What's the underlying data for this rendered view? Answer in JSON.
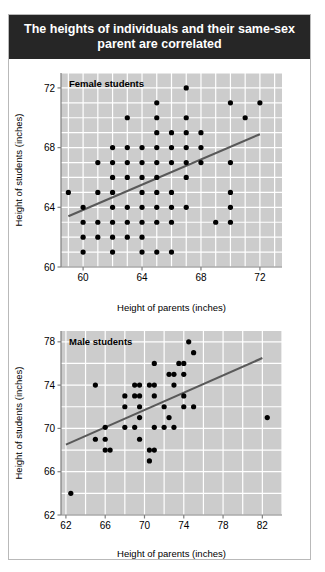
{
  "figure": {
    "title": "The heights of individuals and their same-sex parent are correlated",
    "title_bg": "#262626",
    "title_color": "#ffffff",
    "panel_bg": "#cccccc",
    "grid_color": "#ffffff",
    "point_color": "#000000",
    "line_color": "#595959",
    "axis_color": "#808080",
    "card_bg": "#ffffff",
    "card_border": "#b9b9b9"
  },
  "chart_data": [
    {
      "type": "scatter",
      "name": "female-students-scatter",
      "title": "Female students",
      "xlabel": "Height of parents (inches)",
      "ylabel": "Height of students (inches)",
      "xlim": [
        58.5,
        73.5
      ],
      "ylim": [
        60,
        73
      ],
      "xticks": [
        60,
        64,
        68,
        72
      ],
      "yticks": [
        60,
        64,
        68,
        72
      ],
      "xtick_labels": [
        "60",
        "64",
        "68",
        "72"
      ],
      "ytick_labels": [
        "60",
        "64",
        "68",
        "72"
      ],
      "grid": true,
      "grid_step_x": 1,
      "grid_step_y": 1,
      "legend": "none",
      "trendline": {
        "x0": 59.0,
        "y0": 63.4,
        "x1": 72.0,
        "y1": 68.9
      },
      "points": [
        [
          59.0,
          65.0
        ],
        [
          60.0,
          64.0
        ],
        [
          60.0,
          63.0
        ],
        [
          60.0,
          62.0
        ],
        [
          60.0,
          61.0
        ],
        [
          61.0,
          67.0
        ],
        [
          61.0,
          65.0
        ],
        [
          61.0,
          63.0
        ],
        [
          61.0,
          62.0
        ],
        [
          62.0,
          68.0
        ],
        [
          62.0,
          67.0
        ],
        [
          62.0,
          66.0
        ],
        [
          62.0,
          65.0
        ],
        [
          62.0,
          64.0
        ],
        [
          62.0,
          63.0
        ],
        [
          62.0,
          62.0
        ],
        [
          62.0,
          61.0
        ],
        [
          63.0,
          70.0
        ],
        [
          63.0,
          68.0
        ],
        [
          63.0,
          67.0
        ],
        [
          63.0,
          66.0
        ],
        [
          63.0,
          64.0
        ],
        [
          63.0,
          63.0
        ],
        [
          63.0,
          62.0
        ],
        [
          64.0,
          68.0
        ],
        [
          64.0,
          67.0
        ],
        [
          64.0,
          66.0
        ],
        [
          64.0,
          65.0
        ],
        [
          64.0,
          64.0
        ],
        [
          64.0,
          63.0
        ],
        [
          64.0,
          62.0
        ],
        [
          64.0,
          61.0
        ],
        [
          65.0,
          71.0
        ],
        [
          65.0,
          70.0
        ],
        [
          65.0,
          69.0
        ],
        [
          65.0,
          68.0
        ],
        [
          65.0,
          67.0
        ],
        [
          65.0,
          66.0
        ],
        [
          65.0,
          65.0
        ],
        [
          65.0,
          64.0
        ],
        [
          65.0,
          63.0
        ],
        [
          65.0,
          61.0
        ],
        [
          66.0,
          69.0
        ],
        [
          66.0,
          68.0
        ],
        [
          66.0,
          67.0
        ],
        [
          66.0,
          65.0
        ],
        [
          66.0,
          64.0
        ],
        [
          66.0,
          63.0
        ],
        [
          66.0,
          61.0
        ],
        [
          67.0,
          72.0
        ],
        [
          67.0,
          70.0
        ],
        [
          67.0,
          69.0
        ],
        [
          67.0,
          68.0
        ],
        [
          67.0,
          67.0
        ],
        [
          67.0,
          66.0
        ],
        [
          67.0,
          64.0
        ],
        [
          68.0,
          69.0
        ],
        [
          68.0,
          68.0
        ],
        [
          68.0,
          67.0
        ],
        [
          69.0,
          63.0
        ],
        [
          70.0,
          71.0
        ],
        [
          70.0,
          67.0
        ],
        [
          70.0,
          65.0
        ],
        [
          70.0,
          64.0
        ],
        [
          70.0,
          63.0
        ],
        [
          71.0,
          70.0
        ],
        [
          72.0,
          71.0
        ]
      ]
    },
    {
      "type": "scatter",
      "name": "male-students-scatter",
      "title": "Male students",
      "xlabel": "Height of parents (inches)",
      "ylabel": "Height of students (inches)",
      "xlim": [
        61.5,
        84.0
      ],
      "ylim": [
        62,
        79
      ],
      "xticks": [
        62,
        66,
        70,
        74,
        78,
        82
      ],
      "yticks": [
        62,
        66,
        70,
        74,
        78
      ],
      "xtick_labels": [
        "62",
        "66",
        "70",
        "74",
        "78",
        "82"
      ],
      "ytick_labels": [
        "62",
        "66",
        "70",
        "74",
        "78"
      ],
      "grid": true,
      "grid_step_x": 2,
      "grid_step_y": 2,
      "legend": "none",
      "trendline": {
        "x0": 62.0,
        "y0": 68.5,
        "x1": 82.0,
        "y1": 76.5
      },
      "points": [
        [
          62.5,
          64.0
        ],
        [
          65.0,
          74.0
        ],
        [
          65.0,
          69.0
        ],
        [
          66.0,
          70.1
        ],
        [
          66.0,
          69.0
        ],
        [
          66.0,
          68.0
        ],
        [
          66.5,
          68.0
        ],
        [
          68.0,
          73.0
        ],
        [
          68.0,
          72.0
        ],
        [
          68.0,
          70.1
        ],
        [
          69.0,
          74.0
        ],
        [
          69.0,
          73.0
        ],
        [
          69.0,
          70.1
        ],
        [
          69.5,
          74.0
        ],
        [
          69.5,
          73.0
        ],
        [
          69.5,
          72.0
        ],
        [
          69.5,
          71.0
        ],
        [
          69.5,
          69.0
        ],
        [
          70.5,
          74.0
        ],
        [
          70.5,
          68.0
        ],
        [
          70.5,
          67.0
        ],
        [
          71.0,
          76.0
        ],
        [
          71.0,
          74.0
        ],
        [
          71.0,
          73.0
        ],
        [
          71.0,
          70.1
        ],
        [
          71.0,
          68.0
        ],
        [
          72.0,
          72.0
        ],
        [
          72.0,
          70.1
        ],
        [
          72.5,
          75.0
        ],
        [
          72.5,
          71.0
        ],
        [
          73.0,
          75.0
        ],
        [
          73.0,
          74.0
        ],
        [
          73.0,
          70.1
        ],
        [
          73.5,
          76.0
        ],
        [
          74.0,
          76.0
        ],
        [
          74.0,
          75.0
        ],
        [
          74.0,
          73.0
        ],
        [
          74.0,
          72.0
        ],
        [
          74.5,
          78.0
        ],
        [
          75.0,
          77.0
        ],
        [
          75.0,
          72.0
        ],
        [
          82.5,
          71.0
        ]
      ]
    }
  ]
}
